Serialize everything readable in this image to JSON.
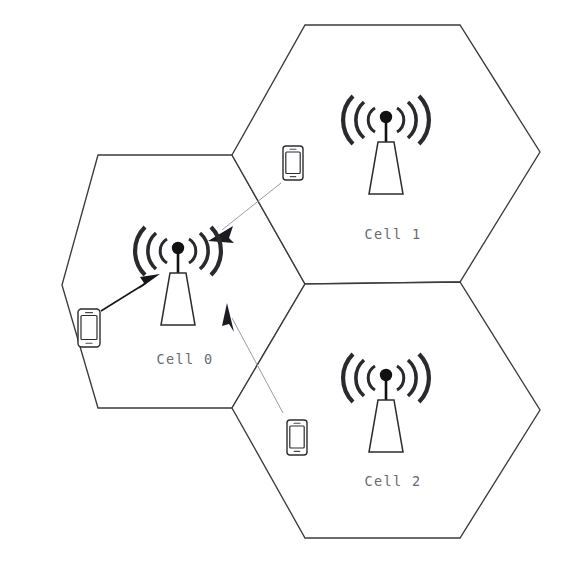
{
  "diagram": {
    "background_color": "#ffffff",
    "width": 562,
    "height": 562,
    "outline_color": "#3b3b3f",
    "label_color": "#6a6a70",
    "strong_link_color": "#16161a",
    "weak_link_color": "#9a9aa2"
  },
  "cells": [
    {
      "id": "cell-0",
      "label": "Cell 0",
      "label_x": 185,
      "label_y": 360,
      "center_x": 185,
      "center_y": 285,
      "hex_points": "98,155 232,155 305,284 232,408 98,408 62,285",
      "tower": {
        "x": 178,
        "y": 237,
        "scale": 1.0
      }
    },
    {
      "id": "cell-1",
      "label": "Cell 1",
      "label_x": 393,
      "label_y": 235,
      "center_x": 382,
      "center_y": 152,
      "hex_points": "305,25 460,25 540,152 460,282 305,284 232,155",
      "tower": {
        "x": 386,
        "y": 106,
        "scale": 1.0
      }
    },
    {
      "id": "cell-2",
      "label": "Cell 2",
      "label_x": 393,
      "label_y": 482,
      "center_x": 382,
      "center_y": 418,
      "hex_points": "305,284 460,282 540,410 460,538 305,538 232,408",
      "tower": {
        "x": 386,
        "y": 364,
        "scale": 1.0
      }
    }
  ],
  "phones": [
    {
      "id": "phone-cell0-user",
      "x": 78,
      "y": 309,
      "w": 22,
      "h": 38,
      "in_cell": "cell-0"
    },
    {
      "id": "phone-cell1-user",
      "x": 283,
      "y": 146,
      "w": 20,
      "h": 34,
      "in_cell": "cell-1"
    },
    {
      "id": "phone-cell2-user",
      "x": 287,
      "y": 420,
      "w": 20,
      "h": 35,
      "in_cell": "cell-2"
    }
  ],
  "links": [
    {
      "id": "link-phone0-to-tower0",
      "style": "strong",
      "from_x": 101,
      "from_y": 311,
      "to_x": 154,
      "to_y": 278,
      "description": "Serving link from Cell 0 user equipment to Cell 0 base station"
    },
    {
      "id": "link-phone1-to-tower0",
      "style": "weak",
      "from_x": 281,
      "from_y": 183,
      "to_x": 213,
      "to_y": 237,
      "description": "Interference link from Cell 1 user equipment toward Cell 0 base station"
    },
    {
      "id": "link-phone2-to-tower0",
      "style": "weak",
      "from_x": 283,
      "from_y": 413,
      "to_x": 227,
      "to_y": 307,
      "description": "Interference link from Cell 2 area toward Cell 0 base station"
    }
  ]
}
